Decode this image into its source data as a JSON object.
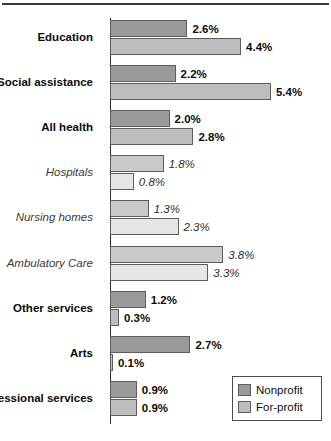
{
  "chart_data": {
    "type": "bar",
    "title": "",
    "subtitle": "",
    "xlabel": "",
    "ylabel": "",
    "orientation": "horizontal",
    "grid": false,
    "xlim": [
      0,
      5.4
    ],
    "axis_unit": "%",
    "legend_position": "bottom-right",
    "categories": [
      "Education",
      "Social assistance",
      "All health",
      "Hospitals",
      "Nursing homes",
      "Ambulatory Care",
      "Other services",
      "Arts",
      "Professional services"
    ],
    "series": [
      {
        "name": "Nonprofit",
        "color": "#9a9a9a",
        "values": [
          2.6,
          2.2,
          2.0,
          1.8,
          1.3,
          3.8,
          1.2,
          2.7,
          0.9
        ]
      },
      {
        "name": "For-profit",
        "color": "#bdbdbd",
        "values": [
          4.4,
          5.4,
          2.8,
          0.8,
          2.3,
          3.3,
          0.3,
          0.1,
          0.9
        ]
      }
    ]
  },
  "rows": [
    {
      "label": "Education",
      "style": "main",
      "nonprofit": {
        "value": 2.6,
        "text": "2.6%"
      },
      "forprofit": {
        "value": 4.4,
        "text": "4.4%"
      }
    },
    {
      "label": "Social assistance",
      "style": "main",
      "nonprofit": {
        "value": 2.2,
        "text": "2.2%"
      },
      "forprofit": {
        "value": 5.4,
        "text": "5.4%"
      }
    },
    {
      "label": "All health",
      "style": "main",
      "nonprofit": {
        "value": 2.0,
        "text": "2.0%"
      },
      "forprofit": {
        "value": 2.8,
        "text": "2.8%"
      }
    },
    {
      "label": "Hospitals",
      "style": "sub",
      "nonprofit": {
        "value": 1.8,
        "text": "1.8%"
      },
      "forprofit": {
        "value": 0.8,
        "text": "0.8%"
      }
    },
    {
      "label": "Nursing homes",
      "style": "sub",
      "nonprofit": {
        "value": 1.3,
        "text": "1.3%"
      },
      "forprofit": {
        "value": 2.3,
        "text": "2.3%"
      }
    },
    {
      "label": "Ambulatory Care",
      "style": "sub",
      "nonprofit": {
        "value": 3.8,
        "text": "3.8%"
      },
      "forprofit": {
        "value": 3.3,
        "text": "3.3%"
      }
    },
    {
      "label": "Other services",
      "style": "main",
      "nonprofit": {
        "value": 1.2,
        "text": "1.2%"
      },
      "forprofit": {
        "value": 0.3,
        "text": "0.3%"
      }
    },
    {
      "label": "Arts",
      "style": "main",
      "nonprofit": {
        "value": 2.7,
        "text": "2.7%"
      },
      "forprofit": {
        "value": 0.1,
        "text": "0.1%"
      }
    },
    {
      "label": "Professional services",
      "style": "main",
      "nonprofit": {
        "value": 0.9,
        "text": "0.9%"
      },
      "forprofit": {
        "value": 0.9,
        "text": "0.9%"
      }
    }
  ],
  "legend": {
    "items": [
      {
        "label": "Nonprofit",
        "color": "#9a9a9a"
      },
      {
        "label": "For-profit",
        "color": "#bdbdbd"
      }
    ]
  }
}
